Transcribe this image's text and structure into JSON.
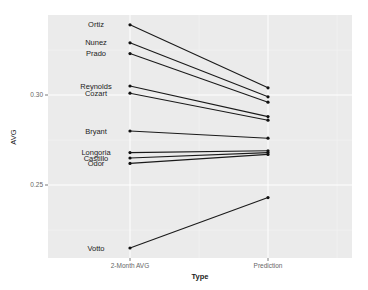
{
  "chart_data": {
    "type": "line",
    "title": "",
    "xlabel": "Type",
    "ylabel": "AVG",
    "categories": [
      "2-Month AVG",
      "Prediction"
    ],
    "ylim": [
      0.205,
      0.348
    ],
    "yticks": [
      0.25,
      0.3
    ],
    "ytick_labels": [
      "0.25",
      "0.30"
    ],
    "grid": true,
    "legend": "none",
    "series": [
      {
        "name": "Ortiz",
        "values": [
          0.339,
          0.304
        ]
      },
      {
        "name": "Nunez",
        "values": [
          0.329,
          0.299
        ]
      },
      {
        "name": "Prado",
        "values": [
          0.323,
          0.296
        ]
      },
      {
        "name": "Reynolds",
        "values": [
          0.305,
          0.288
        ]
      },
      {
        "name": "Cozart",
        "values": [
          0.301,
          0.286
        ]
      },
      {
        "name": "Bryant",
        "values": [
          0.28,
          0.276
        ]
      },
      {
        "name": "Longoria",
        "values": [
          0.268,
          0.269
        ]
      },
      {
        "name": "Castillo",
        "values": [
          0.265,
          0.268
        ]
      },
      {
        "name": "Odor",
        "values": [
          0.262,
          0.267
        ]
      },
      {
        "name": "Votto",
        "values": [
          0.215,
          0.243
        ]
      }
    ]
  },
  "colors": {
    "panel": "#ebebeb",
    "grid": "#ffffff",
    "line": "#1a1a1a"
  }
}
